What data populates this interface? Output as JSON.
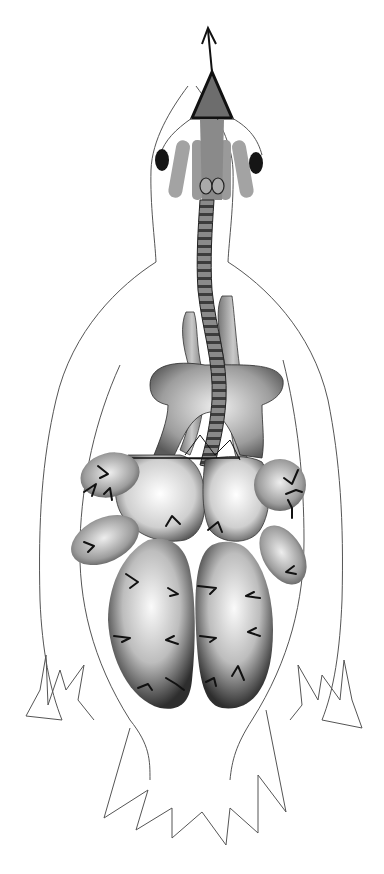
{
  "figure": {
    "title": "",
    "colors": {
      "background": "#ffffff",
      "outline": "#555555",
      "ink": "#111111",
      "organ_dark": "#3a3a3a",
      "organ_light": "#f2f2f2",
      "trachea": "#6a6a6a",
      "head_organs": "#9a9a9a",
      "eye": "#151515"
    },
    "parts": [
      "beak-arrow",
      "beak",
      "eye-left",
      "eye-right",
      "trachea",
      "clavicular-air-sac",
      "cervical-air-sacs",
      "lungs",
      "cranial-thoracic-air-sacs",
      "caudal-thoracic-air-sacs",
      "abdominal-air-sacs",
      "body-outline",
      "wings",
      "tail"
    ]
  }
}
